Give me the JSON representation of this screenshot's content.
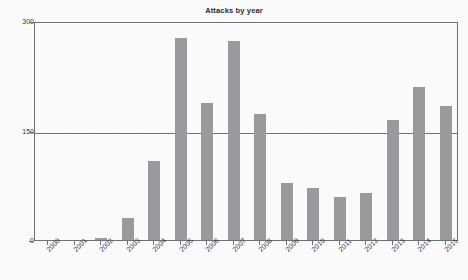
{
  "chart_data": {
    "type": "bar",
    "title": "Attacks by year",
    "xlabel": "",
    "ylabel": "",
    "ylim": [
      0,
      300
    ],
    "yticks": [
      0,
      150,
      300
    ],
    "ytick_labels": [
      "0",
      "150",
      "300"
    ],
    "grid": true,
    "legend": null,
    "bar_color": "#9a9b9e",
    "axis_color": "#6f7278",
    "categories": [
      "2000",
      "2001",
      "2002",
      "2003",
      "2004",
      "2005",
      "2006",
      "2007",
      "2008",
      "2009",
      "2010",
      "2011",
      "2012",
      "2013",
      "2014",
      "2015"
    ],
    "values": [
      0,
      0,
      3,
      30,
      108,
      277,
      188,
      272,
      172,
      78,
      71,
      59,
      64,
      165,
      210,
      184
    ],
    "series": [
      {
        "name": "Attacks",
        "values": [
          0,
          0,
          3,
          30,
          108,
          277,
          188,
          272,
          172,
          78,
          71,
          59,
          64,
          165,
          210,
          184
        ]
      }
    ]
  },
  "colors": {
    "bar": "#9a9b9e",
    "axis": "#6f7278",
    "grid": "#72757b",
    "text": "#32323a",
    "background": "#fcfcfd"
  }
}
